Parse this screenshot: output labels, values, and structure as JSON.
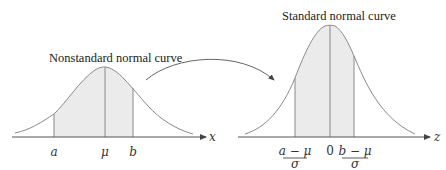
{
  "left_panel": {
    "title": "Nonstandard normal curve",
    "axis_label": "x",
    "tick_labels": {
      "a": "a",
      "mu": "μ",
      "b": "b"
    }
  },
  "right_panel": {
    "title": "Standard normal curve",
    "axis_label": "z",
    "tick_labels": {
      "lower_num": "a − μ",
      "lower_den": "σ",
      "zero": "0",
      "upper_num": "b − μ",
      "upper_den": "σ"
    }
  },
  "colors": {
    "curve": "#8a8a8a",
    "shade": "#ebebeb",
    "axis": "#555555",
    "text": "#222222"
  }
}
